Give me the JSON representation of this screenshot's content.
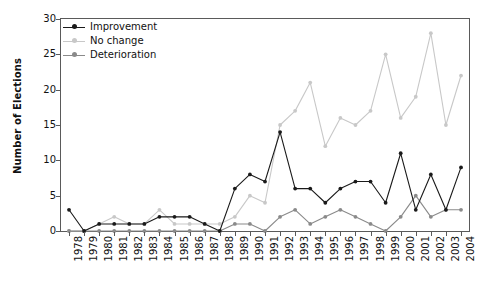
{
  "chart_data": {
    "type": "line",
    "title": "",
    "xlabel": "",
    "ylabel": "Number of Elections",
    "ylim": [
      0,
      30
    ],
    "yticks": [
      0,
      5,
      10,
      15,
      20,
      25,
      30
    ],
    "grid": false,
    "legend_position": "top-left",
    "x": [
      1978,
      1979,
      1980,
      1981,
      1982,
      1983,
      1984,
      1985,
      1986,
      1987,
      1988,
      1989,
      1990,
      1991,
      1992,
      1993,
      1994,
      1995,
      1996,
      1997,
      1998,
      1999,
      2000,
      2001,
      2002,
      2003,
      2004
    ],
    "categories": [
      "1978",
      "1979",
      "1980",
      "1981",
      "1982",
      "1983",
      "1984",
      "1985",
      "1986",
      "1987",
      "1988",
      "1989",
      "1990",
      "1991",
      "1992",
      "1993",
      "1994",
      "1995",
      "1996",
      "1997",
      "1998",
      "1999",
      "2000",
      "2001",
      "2002",
      "2003",
      "2004"
    ],
    "series": [
      {
        "name": "Improvement",
        "color": "#1a1a1a",
        "values": [
          3,
          0,
          1,
          1,
          1,
          1,
          2,
          2,
          2,
          1,
          0,
          6,
          8,
          7,
          14,
          6,
          6,
          4,
          6,
          7,
          7,
          4,
          11,
          3,
          8,
          3,
          9
        ]
      },
      {
        "name": "No change",
        "color": "#c8c8c8",
        "values": [
          0,
          0,
          1,
          2,
          1,
          1,
          3,
          1,
          1,
          1,
          1,
          2,
          5,
          4,
          15,
          17,
          21,
          12,
          16,
          15,
          17,
          25,
          16,
          19,
          28,
          15,
          22
        ]
      },
      {
        "name": "Deterioration",
        "color": "#8a8a8a",
        "values": [
          0,
          0,
          0,
          0,
          0,
          0,
          0,
          0,
          0,
          0,
          0,
          1,
          1,
          0,
          2,
          3,
          1,
          2,
          3,
          2,
          1,
          0,
          2,
          5,
          2,
          3,
          3
        ]
      }
    ]
  },
  "legend": {
    "items": [
      {
        "label": "Improvement",
        "color": "#1a1a1a"
      },
      {
        "label": "No change",
        "color": "#c8c8c8"
      },
      {
        "label": "Deterioration",
        "color": "#8a8a8a"
      }
    ]
  },
  "axis": {
    "y_title": "Number of Elections"
  }
}
